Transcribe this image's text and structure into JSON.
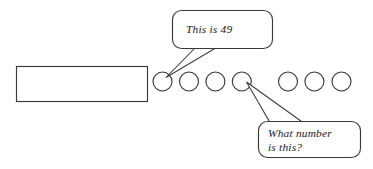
{
  "figure": {
    "background_color": "#ffffff",
    "stroke_color": "#3a3a3a",
    "text_color": "#1a1a1a",
    "bar_rectangle": {
      "name": "bar-rectangle",
      "x": 16,
      "y": 66,
      "width": 131,
      "height": 35,
      "label": ""
    },
    "circles": {
      "count": 7,
      "diameter": 19,
      "spacing": 26.4,
      "first_center_x": 162.5,
      "center_y": 81.5,
      "items": [
        {
          "index": 1,
          "cx": 162.5,
          "cy": 81.5,
          "annotated": true,
          "annotation": "This is 49"
        },
        {
          "index": 2,
          "cx": 189.0,
          "cy": 81.5,
          "annotated": false,
          "annotation": ""
        },
        {
          "index": 3,
          "cx": 215.4,
          "cy": 81.5,
          "annotated": false,
          "annotation": ""
        },
        {
          "index": 4,
          "cx": 241.8,
          "cy": 81.5,
          "annotated": true,
          "annotation": "What number is this?"
        },
        {
          "index": 5,
          "cx": 288.0,
          "cy": 81.5,
          "annotated": false,
          "annotation": ""
        },
        {
          "index": 6,
          "cx": 314.4,
          "cy": 81.5,
          "annotated": false,
          "annotation": ""
        },
        {
          "index": 7,
          "cx": 341.5,
          "cy": 81.5,
          "annotated": false,
          "annotation": ""
        }
      ]
    },
    "callouts": [
      {
        "id": "callout-this-is-49",
        "name": "speech-bubble-this-is-49",
        "lines": [
          "This is 49"
        ],
        "box": {
          "x": 172,
          "y": 10,
          "width": 100,
          "height": 38,
          "radius": 9
        },
        "points_to_circle": 1
      },
      {
        "id": "callout-what-number-is-this",
        "name": "speech-bubble-what-number-is-this",
        "lines": [
          "What number",
          "is this?"
        ],
        "box": {
          "x": 258,
          "y": 121,
          "width": 102,
          "height": 36,
          "radius": 9
        },
        "points_to_circle": 4
      }
    ]
  }
}
